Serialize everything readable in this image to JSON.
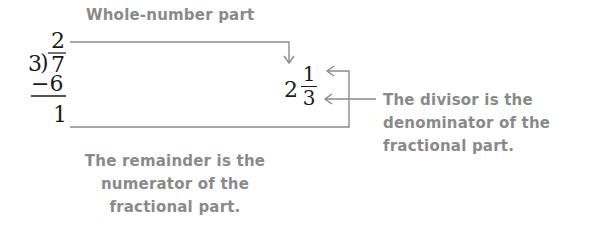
{
  "labels": {
    "whole_number_part": "Whole-number part",
    "divisor_note": [
      "The divisor is the",
      "denominator of the",
      "fractional part."
    ],
    "remainder_note": [
      "The remainder is the",
      "numerator of the",
      "fractional part."
    ]
  },
  "long_division": {
    "quotient": "2",
    "divisor": "3",
    "division_bracket": ")",
    "dividend": "7",
    "subtrahend": "−6",
    "remainder": "1"
  },
  "mixed_number": {
    "whole": "2",
    "numerator": "1",
    "denominator": "3"
  },
  "colors": {
    "arrow": "#8a8a8a",
    "note_text": "#8a8a8a",
    "math_text": "#1a1a1a"
  }
}
